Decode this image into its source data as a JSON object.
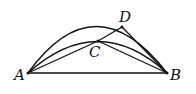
{
  "figure": {
    "type": "geometry",
    "points": {
      "A": {
        "label": "A",
        "x": 28,
        "y": 73
      },
      "B": {
        "label": "B",
        "x": 167,
        "y": 73
      },
      "C": {
        "label": "C",
        "x": 98,
        "y": 41
      },
      "D": {
        "label": "D",
        "x": 122,
        "y": 27
      }
    },
    "segments": [
      "AB",
      "AC",
      "CB",
      "CD",
      "DB"
    ],
    "arcs": [
      "outer arc A-D-B",
      "inner arc A-C-B"
    ],
    "stroke_color": "#111111"
  }
}
